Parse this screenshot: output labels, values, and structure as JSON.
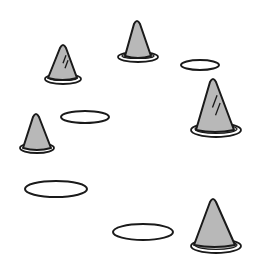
{
  "scene": {
    "description": "Field drill layout with training cones and flat ring markers",
    "width": 254,
    "height": 280,
    "colors": {
      "background": "#ffffff",
      "cone_fill": "#b8b8b8",
      "outline": "#1a1a1a",
      "ring_fill": "#ffffff"
    }
  },
  "cones": [
    {
      "id": "cone-1",
      "apex": [
        63,
        44
      ],
      "base_left": [
        48,
        78
      ],
      "base_right": [
        77,
        78
      ],
      "ring": {
        "cx": 63,
        "cy": 79,
        "rx": 18,
        "ry": 5
      },
      "marks": true
    },
    {
      "id": "cone-2",
      "apex": [
        137,
        20
      ],
      "base_left": [
        125,
        56
      ],
      "base_right": [
        151,
        56
      ],
      "ring": {
        "cx": 138,
        "cy": 57,
        "rx": 20,
        "ry": 5
      },
      "marks": false
    },
    {
      "id": "cone-3",
      "apex": [
        213,
        78
      ],
      "base_left": [
        196,
        130
      ],
      "base_right": [
        234,
        130
      ],
      "ring": {
        "cx": 216,
        "cy": 130,
        "rx": 25,
        "ry": 7
      },
      "marks": true
    },
    {
      "id": "cone-4",
      "apex": [
        36,
        113
      ],
      "base_left": [
        23,
        148
      ],
      "base_right": [
        51,
        148
      ],
      "ring": {
        "cx": 37,
        "cy": 148,
        "rx": 17,
        "ry": 5
      },
      "marks": false
    },
    {
      "id": "cone-5",
      "apex": [
        213,
        198
      ],
      "base_left": [
        194,
        245
      ],
      "base_right": [
        235,
        245
      ],
      "ring": {
        "cx": 216,
        "cy": 246,
        "rx": 25,
        "ry": 7
      },
      "marks": false
    }
  ],
  "rings": [
    {
      "id": "ring-1",
      "cx": 200,
      "cy": 65,
      "rx": 19,
      "ry": 5
    },
    {
      "id": "ring-2",
      "cx": 85,
      "cy": 117,
      "rx": 24,
      "ry": 6
    },
    {
      "id": "ring-3",
      "cx": 56,
      "cy": 189,
      "rx": 31,
      "ry": 8
    },
    {
      "id": "ring-4",
      "cx": 143,
      "cy": 232,
      "rx": 30,
      "ry": 8
    }
  ]
}
